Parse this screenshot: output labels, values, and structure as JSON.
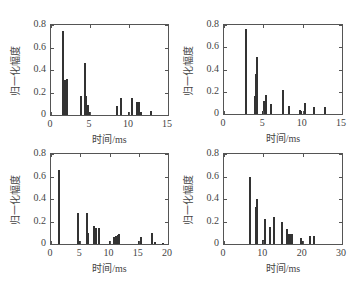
{
  "chart_data": [
    {
      "type": "bar",
      "title": "",
      "xlabel": "时间/ms",
      "ylabel": "归一化幅度",
      "xlim": [
        0,
        15
      ],
      "ylim": [
        0,
        0.8
      ],
      "xticks": [
        "0",
        "5",
        "10",
        "15"
      ],
      "yticks": [
        "0",
        "0.2",
        "0.4",
        "0.6",
        "0.8"
      ],
      "grid": false,
      "x": [
        1.6,
        1.8,
        2.1,
        3.9,
        4.3,
        4.5,
        4.7,
        4.9,
        8.4,
        9.0,
        10.0,
        10.4,
        11.0,
        11.3,
        11.5,
        12.8
      ],
      "values": [
        0.75,
        0.31,
        0.32,
        0.17,
        0.46,
        0.17,
        0.09,
        0.03,
        0.08,
        0.15,
        0.03,
        0.15,
        0.12,
        0.12,
        0.03,
        0.04
      ]
    },
    {
      "type": "bar",
      "title": "",
      "xlabel": "时间/ms",
      "ylabel": "归一化幅度",
      "xlim": [
        0,
        15
      ],
      "ylim": [
        0,
        0.8
      ],
      "xticks": [
        "0",
        "5",
        "10",
        "15"
      ],
      "yticks": [
        "0",
        "0.2",
        "0.4",
        "0.6",
        "0.8"
      ],
      "grid": false,
      "x": [
        2.8,
        4.0,
        4.1,
        4.2,
        5.0,
        5.1,
        5.3,
        6.0,
        7.5,
        8.2,
        9.6,
        9.8,
        10.3,
        11.5,
        12.8
      ],
      "values": [
        0.76,
        0.16,
        0.36,
        0.51,
        0.03,
        0.12,
        0.17,
        0.09,
        0.22,
        0.07,
        0.04,
        0.03,
        0.1,
        0.06,
        0.06
      ]
    },
    {
      "type": "bar",
      "title": "",
      "xlabel": "时间/ms",
      "ylabel": "归一化幅度",
      "xlim": [
        0,
        20
      ],
      "ylim": [
        0,
        0.8
      ],
      "xticks": [
        "0",
        "5",
        "10",
        "15",
        "20"
      ],
      "yticks": [
        "0",
        "0.2",
        "0.4",
        "0.6",
        "0.8"
      ],
      "grid": false,
      "x": [
        1.4,
        4.6,
        4.9,
        6.1,
        6.4,
        7.4,
        7.7,
        8.2,
        10.0,
        10.8,
        11.1,
        11.4,
        11.6,
        15.0,
        15.3,
        17.2,
        17.8,
        19.2
      ],
      "values": [
        0.66,
        0.28,
        0.03,
        0.28,
        0.1,
        0.16,
        0.14,
        0.14,
        0.03,
        0.06,
        0.07,
        0.08,
        0.09,
        0.03,
        0.06,
        0.1,
        0.02,
        0.01
      ]
    },
    {
      "type": "bar",
      "title": "",
      "xlabel": "时间/ms",
      "ylabel": "归一化幅度",
      "xlim": [
        0,
        30
      ],
      "ylim": [
        0,
        0.8
      ],
      "xticks": [
        "0",
        "10",
        "20",
        "30"
      ],
      "yticks": [
        "0",
        "0.2",
        "0.4",
        "0.6",
        "0.8"
      ],
      "grid": false,
      "x": [
        6.6,
        8.2,
        8.5,
        10.0,
        10.3,
        11.8,
        12.8,
        14.7,
        15.9,
        16.5,
        17.1,
        17.4,
        19.6,
        19.9,
        21.8,
        22.8
      ],
      "values": [
        0.6,
        0.33,
        0.4,
        0.04,
        0.22,
        0.15,
        0.24,
        0.2,
        0.13,
        0.09,
        0.09,
        0.09,
        0.05,
        0.03,
        0.07,
        0.07
      ]
    }
  ],
  "labels": {
    "xlabel": "时间/ms",
    "ylabel": "归一化幅度"
  }
}
